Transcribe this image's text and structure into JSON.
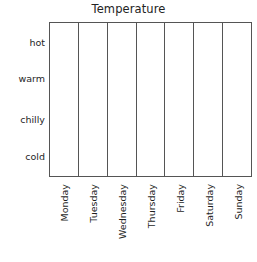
{
  "chart_data": {
    "type": "table",
    "title": "Temperature",
    "xlabel": "",
    "ylabel": "",
    "grid": true,
    "legend": false,
    "orientation": "vertical-columns",
    "note": "Empty blank grid / tally chart: 7 day columns by 4 temperature levels, no data plotted",
    "categories": [
      "Monday",
      "Tuesday",
      "Wednesday",
      "Thursday",
      "Friday",
      "Saturday",
      "Sunday"
    ],
    "y_categories": [
      "hot",
      "warm",
      "chilly",
      "cold"
    ],
    "values": [
      null,
      null,
      null,
      null,
      null,
      null,
      null
    ],
    "series": []
  },
  "title": {
    "text": "Temperature"
  },
  "y_axis": {
    "labels": [
      {
        "text": "hot",
        "key": "hot"
      },
      {
        "text": "warm",
        "key": "warm"
      },
      {
        "text": "chilly",
        "key": "chilly"
      },
      {
        "text": "cold",
        "key": "cold"
      }
    ]
  },
  "x_axis": {
    "labels": [
      {
        "text": "Monday"
      },
      {
        "text": "Tuesday"
      },
      {
        "text": "Wednesday"
      },
      {
        "text": "Thursday"
      },
      {
        "text": "Friday"
      },
      {
        "text": "Saturday"
      },
      {
        "text": "Sunday"
      }
    ]
  },
  "style": {
    "line_color": "#555555",
    "text_color": "#1f1f1f",
    "title_color": "#232323",
    "background": "#ffffff"
  }
}
